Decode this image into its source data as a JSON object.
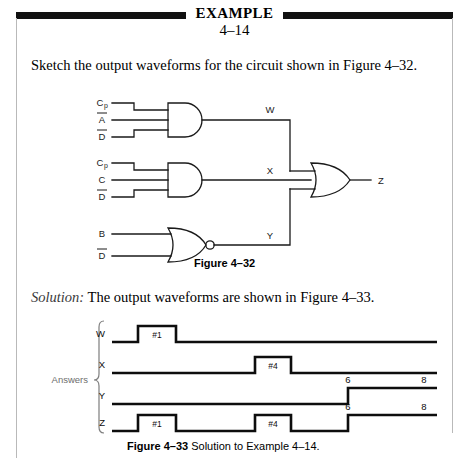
{
  "header": {
    "title": "EXAMPLE",
    "number": "4–14"
  },
  "statement": "Sketch the output waveforms for the circuit shown in Figure 4–32.",
  "solution": {
    "label": "Solution:",
    "text": "The output waveforms are shown in Figure 4–33."
  },
  "figure_32": {
    "caption": "Figure 4–32",
    "gates": [
      {
        "name": "gate-and-1",
        "type": "AND",
        "inputs": [
          "Cₚ",
          "A̅",
          "D̅"
        ],
        "output": "W"
      },
      {
        "name": "gate-and-2",
        "type": "AND",
        "inputs": [
          "Cₚ",
          "C",
          "D̅"
        ],
        "output": "X"
      },
      {
        "name": "gate-nor-1",
        "type": "NOR",
        "inputs": [
          "B",
          "D̅"
        ],
        "output": "Y"
      },
      {
        "name": "gate-or-out",
        "type": "OR",
        "inputs": [
          "W",
          "X",
          "Y"
        ],
        "output": "Z"
      }
    ],
    "input_labels": {
      "g1_a": "Cₚ",
      "g1_b": "A",
      "g1_c": "D",
      "g2_a": "Cₚ",
      "g2_b": "C",
      "g2_c": "D",
      "g3_a": "B",
      "g3_b": "D"
    },
    "node_labels": {
      "w": "W",
      "x": "X",
      "y": "Y",
      "z": "Z"
    }
  },
  "figure_33": {
    "caption_bold": "Figure 4–33",
    "caption_rest": "Solution to Example 4–14.",
    "brace_label": "Answers",
    "waveforms": [
      {
        "name": "W",
        "label": "W",
        "pulses": [
          {
            "label": "#1",
            "start": 138,
            "end": 176
          }
        ],
        "tick_labels": []
      },
      {
        "name": "X",
        "label": "X",
        "pulses": [
          {
            "label": "#4",
            "start": 255,
            "end": 291
          }
        ],
        "tick_labels": []
      },
      {
        "name": "Y",
        "label": "Y",
        "pulses": [
          {
            "label": "",
            "start": 348,
            "end": 437
          }
        ],
        "tick_labels": [
          {
            "text": "6",
            "x": 348
          },
          {
            "text": "8",
            "x": 424
          }
        ]
      },
      {
        "name": "Z",
        "label": "Z",
        "pulses": [
          {
            "label": "#1",
            "start": 138,
            "end": 176
          },
          {
            "label": "#4",
            "start": 255,
            "end": 291
          },
          {
            "label": "",
            "start": 348,
            "end": 437
          }
        ],
        "tick_labels": [
          {
            "text": "6",
            "x": 348
          },
          {
            "text": "8",
            "x": 424
          }
        ]
      }
    ]
  },
  "colors": {
    "ink": "#000000",
    "rule": "#b9b9b9",
    "muted": "#3a3a3a"
  }
}
